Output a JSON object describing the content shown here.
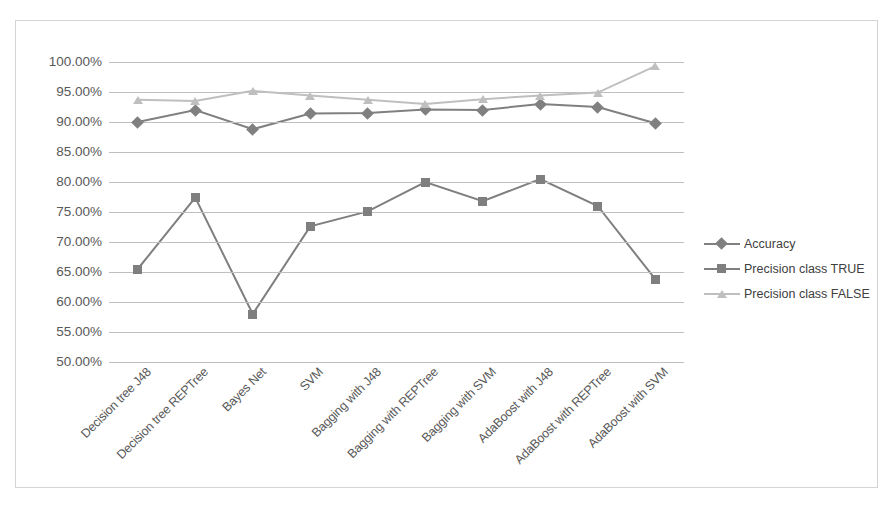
{
  "chart_data": {
    "type": "line",
    "title": "",
    "xlabel": "",
    "ylabel": "",
    "ylim": [
      50,
      100
    ],
    "ytick_format": "percent",
    "grid": true,
    "legend_position": "right",
    "categories": [
      "Decision tree J48",
      "Decision tree REPTree",
      "Bayes Net",
      "SVM",
      "Bagging with J48",
      "Bagging with REPTree",
      "Bagging with SVM",
      "AdaBoost with J48",
      "AdaBoost with REPTree",
      "AdaBoost with SVM"
    ],
    "yticks": [
      "50.00%",
      "55.00%",
      "60.00%",
      "65.00%",
      "70.00%",
      "75.00%",
      "80.00%",
      "85.00%",
      "90.00%",
      "95.00%",
      "100.00%"
    ],
    "series": [
      {
        "name": "Accuracy",
        "marker": "diamond",
        "color": "#808080",
        "values": [
          90.0,
          92.0,
          88.8,
          91.4,
          91.5,
          92.1,
          92.0,
          93.0,
          92.5,
          89.8
        ]
      },
      {
        "name": "Precision class TRUE",
        "marker": "square",
        "color": "#7f7f7f",
        "values": [
          65.5,
          77.4,
          58.0,
          72.6,
          75.1,
          80.0,
          76.8,
          80.5,
          76.0,
          63.8
        ]
      },
      {
        "name": "Precision class FALSE",
        "marker": "triangle",
        "color": "#bfbfbf",
        "values": [
          93.7,
          93.5,
          95.2,
          94.4,
          93.7,
          93.0,
          93.8,
          94.4,
          94.9,
          99.3
        ]
      }
    ]
  },
  "colors": {
    "grid": "#bfbfbf",
    "border": "#d4d4d4",
    "text": "#595959",
    "accuracy": "#808080",
    "precision_true": "#7f7f7f",
    "precision_false": "#bfbfbf",
    "background": "#ffffff"
  }
}
